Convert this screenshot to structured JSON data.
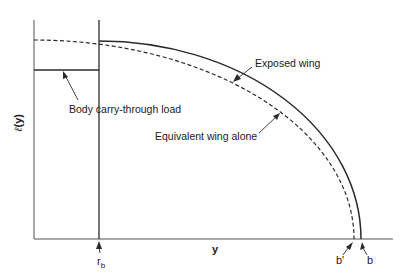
{
  "diagram": {
    "type": "spanwise lift distribution",
    "colors": {
      "line": "#2a2a2a",
      "axis": "#555555",
      "background": "#ffffff"
    },
    "axes": {
      "y_label_symbol": "ℓ",
      "y_label_arg": "(y)",
      "x_label": "y"
    },
    "ticks": {
      "rb_main": "r",
      "rb_sub": "b",
      "b_prime": "b'",
      "b": "b"
    },
    "annotations": {
      "exposed_wing": "Exposed wing",
      "equivalent_wing": "Equivalent wing alone",
      "body_carry_through": "Body carry-through load"
    },
    "curves": [
      {
        "name": "Exposed wing",
        "style": "solid",
        "from": "r_b",
        "to": "b"
      },
      {
        "name": "Equivalent wing alone",
        "style": "dashed",
        "from": "0",
        "to": "b'"
      },
      {
        "name": "Body carry-through load",
        "style": "solid-horizontal",
        "from": "0",
        "to": "r_b"
      }
    ]
  }
}
